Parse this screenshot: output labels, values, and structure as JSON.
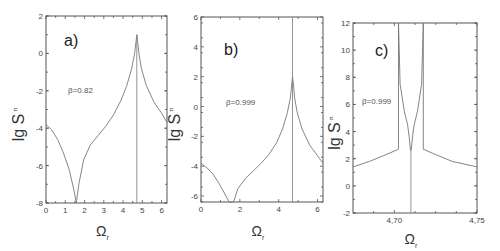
{
  "chart_data": [
    {
      "type": "line",
      "panel_label": "a)",
      "annotation": "β=0.82",
      "xlabel": "Ω",
      "xlabel_sub": "r",
      "ylabel": "lg S",
      "ylabel_sub": "π",
      "xlim": [
        0,
        6.28
      ],
      "ylim": [
        -8,
        2
      ],
      "xticks": [
        "0",
        "1",
        "2",
        "3",
        "4",
        "5",
        "6"
      ],
      "yticks": [
        "2",
        "0",
        "-2",
        "-4",
        "-6",
        "-8"
      ],
      "grid": false,
      "series": [
        {
          "name": "lg S_π",
          "x": [
            0,
            0.3,
            0.6,
            0.9,
            1.2,
            1.45,
            1.57,
            1.7,
            1.95,
            2.3,
            2.7,
            3.1,
            3.5,
            3.9,
            4.2,
            4.45,
            4.6,
            4.68,
            4.71,
            4.75,
            4.82,
            4.95,
            5.2,
            5.6,
            6.0,
            6.28
          ],
          "y": [
            -3.8,
            -4.1,
            -4.6,
            -5.3,
            -6.2,
            -7.3,
            -8.0,
            -7.0,
            -5.7,
            -4.9,
            -4.4,
            -3.9,
            -3.3,
            -2.5,
            -1.7,
            -0.8,
            0.0,
            0.7,
            1.0,
            0.7,
            0.0,
            -0.8,
            -1.7,
            -2.6,
            -3.2,
            -3.7
          ]
        },
        {
          "name": "resonance line",
          "x": [
            4.71,
            4.71
          ],
          "y": [
            -8,
            1.0
          ]
        }
      ]
    },
    {
      "type": "line",
      "panel_label": "b)",
      "annotation": "β=0.999",
      "xlabel": "Ω",
      "xlabel_sub": "r",
      "ylabel": "lg S",
      "ylabel_sub": "π",
      "xlim": [
        0,
        6.28
      ],
      "ylim": [
        -6.4,
        6
      ],
      "xticks": [
        "0",
        "2",
        "4",
        "6"
      ],
      "yticks": [
        "6",
        "4",
        "2",
        "0",
        "-2",
        "-4",
        "-6"
      ],
      "grid": false,
      "series": [
        {
          "name": "lg S_π",
          "x": [
            0,
            0.3,
            0.6,
            0.9,
            1.2,
            1.45,
            1.55,
            1.68,
            1.9,
            2.3,
            2.7,
            3.1,
            3.5,
            3.9,
            4.2,
            4.45,
            4.6,
            4.68,
            4.71,
            4.75,
            4.82,
            4.95,
            5.2,
            5.6,
            6.0,
            6.28
          ],
          "y": [
            -3.8,
            -4.1,
            -4.5,
            -5.1,
            -5.8,
            -6.4,
            -6.4,
            -6.4,
            -5.5,
            -4.8,
            -4.3,
            -3.8,
            -3.2,
            -2.4,
            -1.5,
            -0.4,
            0.6,
            1.6,
            2.0,
            1.6,
            0.6,
            -0.4,
            -1.5,
            -2.6,
            -3.3,
            -3.8
          ]
        },
        {
          "name": "resonance line",
          "x": [
            4.71,
            4.71
          ],
          "y": [
            -6.4,
            6
          ]
        }
      ]
    },
    {
      "type": "line",
      "panel_label": "c)",
      "annotation": "β=0.999",
      "xlabel": "Ω",
      "xlabel_sub": "r",
      "ylabel": "lg S",
      "ylabel_sub": "π",
      "xlim": [
        4.675,
        4.75
      ],
      "ylim": [
        -2,
        12
      ],
      "xticks": [
        "4,70",
        "4,75"
      ],
      "xtick_values": [
        4.7,
        4.75
      ],
      "yticks": [
        "12",
        "10",
        "8",
        "6",
        "4",
        "2",
        "0",
        "-2"
      ],
      "grid": false,
      "series": [
        {
          "name": "lg S_π outer left",
          "x": [
            4.675,
            4.685,
            4.695,
            4.7025,
            4.7025
          ],
          "y": [
            1.4,
            1.8,
            2.3,
            2.7,
            12
          ]
        },
        {
          "name": "lg S_π outer right",
          "x": [
            4.7175,
            4.7175,
            4.725,
            4.735,
            4.75
          ],
          "y": [
            12,
            2.7,
            2.3,
            1.8,
            1.4
          ]
        },
        {
          "name": "lg S_π inner left",
          "x": [
            4.7025,
            4.7035,
            4.706,
            4.708,
            4.709,
            4.7095,
            4.7098
          ],
          "y": [
            12,
            7.5,
            5.5,
            4.5,
            3.6,
            3.0,
            2.6
          ]
        },
        {
          "name": "lg S_π inner right",
          "x": [
            4.7175,
            4.7165,
            4.714,
            4.712,
            4.711,
            4.7105,
            4.7102
          ],
          "y": [
            12,
            7.5,
            5.5,
            4.5,
            3.6,
            3.0,
            2.6
          ]
        },
        {
          "name": "resonance line",
          "x": [
            4.71,
            4.71
          ],
          "y": [
            -2,
            2.6
          ]
        }
      ]
    }
  ]
}
